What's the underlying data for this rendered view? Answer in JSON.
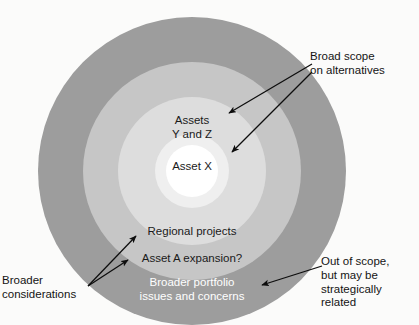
{
  "figure": {
    "type": "concentric-ring-diagram",
    "center": {
      "x": 192,
      "y": 171
    },
    "rings": [
      {
        "id": "ring-outer",
        "name": "broader-portfolio-ring",
        "radius": 154,
        "color": "#9d9d9d",
        "label": "Broader portfolio\nissues and concerns",
        "label_color": "#ffffff"
      },
      {
        "id": "ring-2",
        "name": "asset-a-expansion-ring",
        "radius": 109,
        "color": "#c6c6c6",
        "label": "Asset A expansion?",
        "label_color": "#141414"
      },
      {
        "id": "ring-3",
        "name": "regional-projects-ring",
        "radius": 74,
        "color": "#dddddd",
        "label": "Regional projects",
        "label_color": "#141414"
      },
      {
        "id": "ring-4",
        "name": "assets-y-and-z-ring",
        "radius": 37,
        "color": "#efefef",
        "label": "Assets\nY and Z",
        "label_color": "#141414"
      },
      {
        "id": "ring-core",
        "name": "asset-x-core",
        "radius": 26,
        "color": "#ffffff",
        "label": "Asset X",
        "label_color": "#141414"
      }
    ],
    "callouts": [
      {
        "id": "callout-broad-scope",
        "name": "broad-scope-callout",
        "text": "Broad scope\non alternatives",
        "anchor": "top-right",
        "arrows": 2,
        "targets": [
          "Assets Y and Z",
          "Asset X"
        ]
      },
      {
        "id": "callout-broader-considerations",
        "name": "broader-considerations-callout",
        "text": "Broader\nconsiderations",
        "anchor": "bottom-left",
        "arrows": 2,
        "targets": [
          "Regional projects",
          "Asset A expansion?"
        ]
      },
      {
        "id": "callout-out-of-scope",
        "name": "out-of-scope-callout",
        "text": "Out of scope,\nbut may be\nstrategically\nrelated",
        "anchor": "bottom-right",
        "arrows": 1,
        "targets": [
          "Broader portfolio issues and concerns"
        ]
      }
    ],
    "colors": {
      "background": "#fbfbfa",
      "arrow": "#0d0d0d",
      "text": "#141414",
      "inverse_text": "#ffffff"
    }
  },
  "labels": {
    "asset_x": "Asset X",
    "assets_y_and_z": "Assets\nY and Z",
    "regional_projects": "Regional projects",
    "asset_a_expansion": "Asset A expansion?",
    "broader_portfolio": "Broader portfolio\nissues and concerns"
  },
  "callout_text": {
    "broad_scope": "Broad scope\non alternatives",
    "broader_considerations": "Broader\nconsiderations",
    "out_of_scope": "Out of scope,\nbut may be\nstrategically\nrelated"
  }
}
